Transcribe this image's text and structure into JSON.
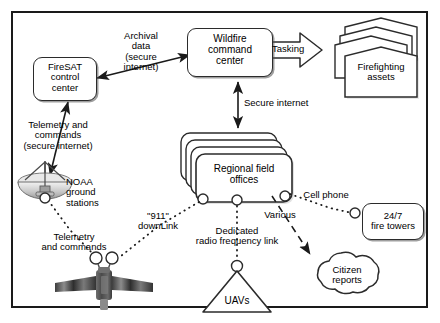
{
  "diagram": {
    "frame": {
      "border_color": "#1a1a1a"
    },
    "nodes": {
      "firesat_control": {
        "label": "FireSAT\ncontrol\ncenter",
        "shape": "rounded-rect"
      },
      "wildfire_command": {
        "label": "Wildfire\ncommand\ncenter",
        "shape": "rounded-rect"
      },
      "firefighting_assets": {
        "label": "Firefighting\nassets",
        "shape": "pentagon-stack"
      },
      "regional_field_offices": {
        "label": "Regional field\noffices",
        "shape": "rounded-rect-stack"
      },
      "noaa_ground_stations": {
        "label": "NOAA\nground\nstations",
        "shape": "dish-antenna"
      },
      "satellite": {
        "label": "",
        "shape": "satellite"
      },
      "uavs": {
        "label": "UAVs",
        "shape": "triangle"
      },
      "citizen_reports": {
        "label": "Citizen\nreports",
        "shape": "cloud"
      },
      "fire_towers": {
        "label": "24/7\nfire towers",
        "shape": "rounded-rect"
      }
    },
    "edges": {
      "archival_data": {
        "label": "Archival\ndata\n(secure\ninternet)",
        "style": "double-arrow"
      },
      "tasking": {
        "label": "Tasking",
        "style": "block-arrow"
      },
      "secure_internet": {
        "label": "Secure internet",
        "style": "double-arrow"
      },
      "telemetry_commands_secure": {
        "label": "Telemetry and\ncommands\n(secure internet)",
        "style": "double-arrow"
      },
      "telemetry_commands": {
        "label": "Telemetry\nand commands",
        "style": "dotted"
      },
      "downlink_911": {
        "label": "\"911\"\ndownLink",
        "style": "dotted"
      },
      "dedicated_radio": {
        "label": "Dedicated\nradio frequency link",
        "style": "dotted"
      },
      "various": {
        "label": "Various",
        "style": "dashed-arrow"
      },
      "cell_phone": {
        "label": "Cell phone",
        "style": "dotted"
      }
    },
    "colors": {
      "line": "#2b2b2b",
      "text": "#000000",
      "background": "#ffffff",
      "satellite_body": "#555555",
      "satellite_panel": "#3a3a3a",
      "dish": "#d9d9d9"
    }
  }
}
